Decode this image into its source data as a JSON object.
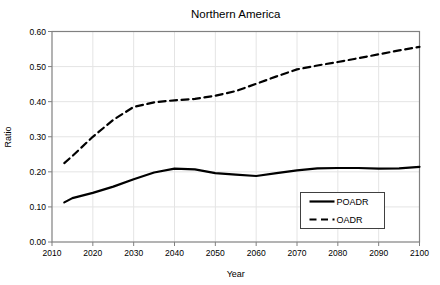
{
  "chart_data": {
    "type": "line",
    "title": "Northern America",
    "xlabel": "Year",
    "ylabel": "Ratio",
    "xlim": [
      2010,
      2100
    ],
    "ylim": [
      0.0,
      0.6
    ],
    "xticks": [
      2010,
      2020,
      2030,
      2040,
      2050,
      2060,
      2070,
      2080,
      2090,
      2100
    ],
    "xtick_labels": [
      "2010",
      "2020",
      "2030",
      "2040",
      "2050",
      "2060",
      "2070",
      "2080",
      "2090",
      "2100"
    ],
    "yticks": [
      0.0,
      0.1,
      0.2,
      0.3,
      0.4,
      0.5,
      0.6
    ],
    "ytick_labels": [
      "0.00",
      "0.10",
      "0.20",
      "0.30",
      "0.40",
      "0.50",
      "0.60"
    ],
    "grid": true,
    "legend_position": "inside lower right",
    "x": [
      2013,
      2015,
      2020,
      2025,
      2030,
      2035,
      2040,
      2045,
      2050,
      2055,
      2060,
      2065,
      2070,
      2075,
      2080,
      2085,
      2090,
      2095,
      2100
    ],
    "series": [
      {
        "name": "POADR",
        "line_style": "solid",
        "color": "#000000",
        "values": [
          0.113,
          0.125,
          0.14,
          0.158,
          0.179,
          0.198,
          0.209,
          0.207,
          0.196,
          0.192,
          0.188,
          0.196,
          0.204,
          0.21,
          0.211,
          0.211,
          0.209,
          0.21,
          0.214
        ]
      },
      {
        "name": "OADR",
        "line_style": "dashed",
        "color": "#000000",
        "values": [
          0.225,
          0.245,
          0.3,
          0.348,
          0.385,
          0.398,
          0.404,
          0.408,
          0.417,
          0.43,
          0.451,
          0.472,
          0.492,
          0.503,
          0.513,
          0.524,
          0.535,
          0.546,
          0.556
        ]
      }
    ]
  },
  "colors": {
    "background": "#ffffff",
    "line": "#000000",
    "grid": "#e4e4e4",
    "frame": "#808080",
    "tick": "#808080",
    "text": "#000000",
    "legend_border": "#404040",
    "legend_fill": "#ffffff"
  }
}
